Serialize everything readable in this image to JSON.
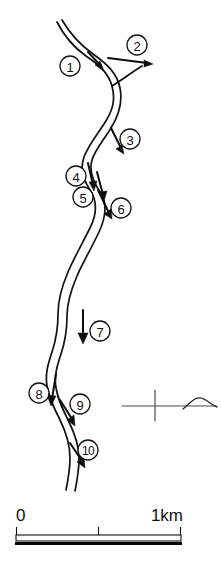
{
  "figure": {
    "type": "map",
    "background_color": "#ffffff",
    "line_color": "#111111",
    "width": 221,
    "height": 574
  },
  "river": {
    "name": "river-channel",
    "description": "meandering double-line river channel flowing from top to bottom",
    "bank_left_path": "M 57 22 C 63 34, 72 46, 86 56 C 99 65, 108 72, 112 86 C 116 101, 112 112, 104 124 C 96 136, 88 146, 84 157 C 80 168, 82 178, 90 190 C 98 202, 97 214, 90 228 C 83 242, 74 258, 68 272 C 62 286, 58 300, 58 314 C 58 328, 56 340, 52 352 C 48 364, 45 374, 47 386 C 49 398, 54 408, 60 420 C 66 432, 70 446, 70 458 C 70 470, 68 480, 66 490",
    "bank_right_path": "M 62 20 C 69 32, 79 44, 93 54 C 107 64, 117 73, 120 88 C 123 103, 119 115, 111 128 C 103 141, 95 150, 92 160 C 89 170, 92 180, 100 192 C 108 204, 106 217, 99 232 C 92 247, 83 262, 77 276 C 71 290, 67 303, 67 316 C 67 330, 65 342, 61 354 C 57 366, 54 376, 56 388 C 58 400, 63 410, 69 422 C 75 434, 79 447, 79 459 C 79 471, 77 481, 75 491",
    "branch_path": "M 112 86 C 122 80, 132 72, 142 66"
  },
  "flow_markers": [
    {
      "id": 1,
      "label": "1",
      "circle": {
        "cx": 70,
        "cy": 66,
        "r": 10
      },
      "arrow": {
        "tail_x": 88,
        "tail_y": 52,
        "tip_x": 104,
        "tip_y": 70,
        "angle_deg": 48
      },
      "note": "flow arrow on upstream reach, pointing down-right"
    },
    {
      "id": 2,
      "label": "2",
      "circle": {
        "cx": 137,
        "cy": 45,
        "r": 10
      },
      "arrow": {
        "tail_x": 108,
        "tail_y": 58,
        "tip_x": 152,
        "tip_y": 64,
        "angle_deg": 8
      },
      "note": "tributary / distributary branch arrow pointing right"
    },
    {
      "id": 3,
      "label": "3",
      "circle": {
        "cx": 130,
        "cy": 139,
        "r": 10
      },
      "arrow": {
        "tail_x": 111,
        "tail_y": 128,
        "tip_x": 123,
        "tip_y": 153,
        "angle_deg": 64
      },
      "note": "arrow pointing down-right"
    },
    {
      "id": 4,
      "label": "4",
      "circle": {
        "cx": 76,
        "cy": 176,
        "r": 10
      },
      "arrow": {
        "tail_x": 88,
        "tail_y": 163,
        "tip_x": 94,
        "tip_y": 190,
        "angle_deg": 77
      },
      "note": "arrow pointing down"
    },
    {
      "id": 5,
      "label": "5",
      "circle": {
        "cx": 83,
        "cy": 197,
        "r": 10
      },
      "arrow": {
        "tail_x": 97,
        "tail_y": 172,
        "tip_x": 104,
        "tip_y": 200,
        "angle_deg": 76
      },
      "note": "arrow pointing down"
    },
    {
      "id": 6,
      "label": "6",
      "circle": {
        "cx": 121,
        "cy": 208,
        "r": 10
      },
      "arrow": {
        "tail_x": 98,
        "tail_y": 190,
        "tip_x": 111,
        "tip_y": 218,
        "angle_deg": 65
      },
      "note": "arrow pointing down-right"
    },
    {
      "id": 7,
      "label": "7",
      "circle": {
        "cx": 100,
        "cy": 331,
        "r": 10
      },
      "arrow": {
        "tail_x": 83,
        "tail_y": 310,
        "tip_x": 83,
        "tip_y": 342,
        "angle_deg": 90
      },
      "note": "arrow pointing straight down"
    },
    {
      "id": 8,
      "label": "8",
      "circle": {
        "cx": 39,
        "cy": 393,
        "r": 10
      },
      "arrow": {
        "tail_x": 56,
        "tail_y": 374,
        "tip_x": 52,
        "tip_y": 404,
        "angle_deg": 98
      },
      "note": "arrow pointing down"
    },
    {
      "id": 9,
      "label": "9",
      "circle": {
        "cx": 80,
        "cy": 404,
        "r": 10
      },
      "arrow": {
        "tail_x": 60,
        "tail_y": 400,
        "tip_x": 74,
        "tip_y": 424,
        "angle_deg": 60
      },
      "note": "arrow pointing down-right"
    },
    {
      "id": 10,
      "label": "10",
      "circle": {
        "cx": 88,
        "cy": 450,
        "r": 10
      },
      "arrow": {
        "tail_x": 70,
        "tail_y": 443,
        "tip_x": 84,
        "tip_y": 466,
        "angle_deg": 58
      },
      "note": "arrow pointing down-right"
    }
  ],
  "inset": {
    "name": "inset-index-sketch",
    "axis_line": {
      "x1": 122,
      "y1": 406,
      "x2": 216,
      "y2": 406
    },
    "axis_tick": {
      "x": 155,
      "y1": 390,
      "y2": 421
    },
    "shape_path": "M 183 409 C 187 406, 190 402, 195 399 C 200 396, 205 399, 210 403 C 213 405, 215 406, 217 407",
    "line_color": "#4a4a4a"
  },
  "scale_bar": {
    "name": "scale-bar",
    "left_label": "0",
    "right_label": "1km",
    "x_start": 16,
    "x_end": 181,
    "x_mid": 98,
    "bar_top_y": 530,
    "bar_bottom_y": 541,
    "tick_top_y": 527,
    "label_y": 521,
    "units": "km",
    "total_length_value": 1
  }
}
